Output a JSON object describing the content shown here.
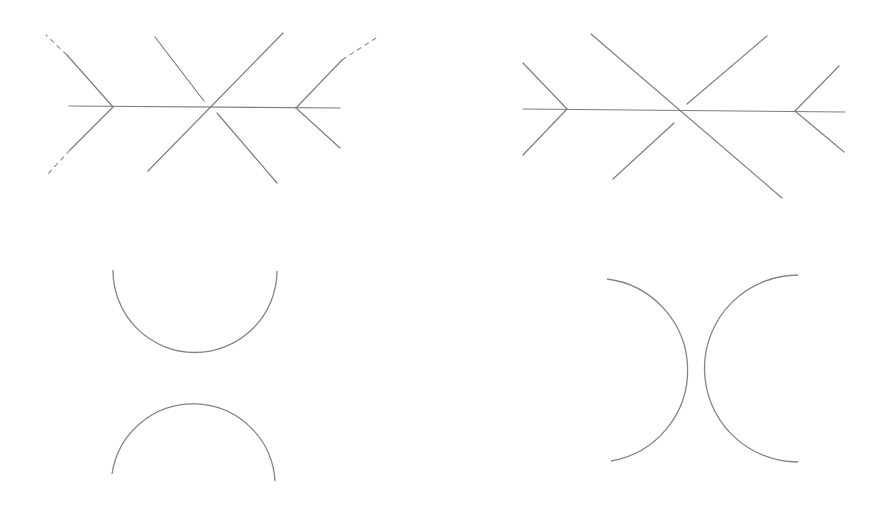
{
  "diagram": {
    "title": "",
    "stroke_color": "#7f7f7f",
    "background": "#ffffff",
    "figures": [
      {
        "id": "top-left-mueller-lyer-cross",
        "main_line": [
          [
            69,
            106
          ],
          [
            340,
            108
          ]
        ],
        "solid_lines": [
          [
            [
              113,
              107
            ],
            [
              67,
              55
            ]
          ],
          [
            [
              113,
              107
            ],
            [
              70,
              150
            ]
          ],
          [
            [
              283,
              33
            ],
            [
              148,
              171
            ]
          ],
          [
            [
              155,
              37
            ],
            [
              204,
              101
            ]
          ],
          [
            [
              217,
              113
            ],
            [
              277,
              183
            ]
          ],
          [
            [
              296,
              108
            ],
            [
              342,
              60
            ]
          ],
          [
            [
              296,
              108
            ],
            [
              340,
              148
            ]
          ]
        ],
        "dashed_lines": [
          [
            [
              67,
              55
            ],
            [
              46,
              35
            ]
          ],
          [
            [
              70,
              150
            ],
            [
              46,
              176
            ]
          ],
          [
            [
              342,
              60
            ],
            [
              376,
              38
            ]
          ]
        ]
      },
      {
        "id": "top-right-mueller-lyer-cross",
        "main_line": [
          [
            523,
            109
          ],
          [
            845,
            112
          ]
        ],
        "solid_lines": [
          [
            [
              567,
              109
            ],
            [
              523,
              63
            ]
          ],
          [
            [
              567,
              109
            ],
            [
              523,
              155
            ]
          ],
          [
            [
              591,
              34
            ],
            [
              782,
              198
            ]
          ],
          [
            [
              687,
              104
            ],
            [
              767,
              36
            ]
          ],
          [
            [
              674,
              123
            ],
            [
              613,
              179
            ]
          ],
          [
            [
              795,
              111
            ],
            [
              839,
              66
            ]
          ],
          [
            [
              795,
              111
            ],
            [
              844,
              152
            ]
          ]
        ],
        "dashed_lines": []
      },
      {
        "id": "bottom-left-arcs",
        "arcs": [
          {
            "d": "M113,270 A82,82 0 0 0 277,271"
          },
          {
            "d": "M112,474 A82,82 0 0 1 275,481"
          }
        ]
      },
      {
        "id": "bottom-right-arcs",
        "arcs": [
          {
            "d": "M607,279 A92,92 0 0 1 611,461"
          },
          {
            "d": "M798,275 A92,92 0 0 0 798,462"
          }
        ]
      }
    ]
  }
}
